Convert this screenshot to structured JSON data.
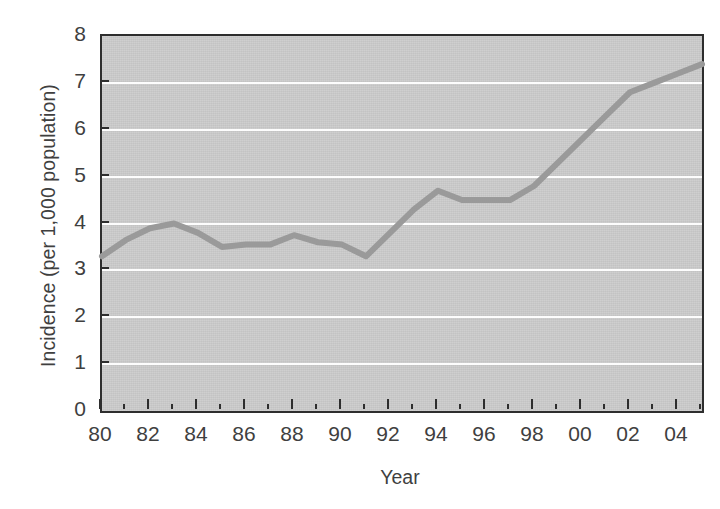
{
  "chart_data": {
    "type": "line",
    "title": "",
    "subtitle": "",
    "xlabel": "Year",
    "ylabel": "Incidence (per 1,000 population)",
    "xlim": [
      1980,
      2005
    ],
    "ylim": [
      0,
      8
    ],
    "grid": true,
    "grid_axis": "y",
    "legend": "none",
    "x_tick_labels": [
      "80",
      "82",
      "84",
      "86",
      "88",
      "90",
      "92",
      "94",
      "96",
      "98",
      "00",
      "02",
      "04"
    ],
    "x_tick_values": [
      1980,
      1982,
      1984,
      1986,
      1988,
      1990,
      1992,
      1994,
      1996,
      1998,
      2000,
      2002,
      2004
    ],
    "x_minor_tick_values": [
      1981,
      1983,
      1985,
      1987,
      1989,
      1991,
      1993,
      1995,
      1997,
      1999,
      2001,
      2003,
      2005
    ],
    "y_tick_labels": [
      "0",
      "1",
      "2",
      "3",
      "4",
      "5",
      "6",
      "7",
      "8"
    ],
    "y_tick_values": [
      0,
      1,
      2,
      3,
      4,
      5,
      6,
      7,
      8
    ],
    "gridline_values": [
      1,
      2,
      3,
      4,
      5,
      6,
      7
    ],
    "x": [
      1980,
      1981,
      1982,
      1983,
      1984,
      1985,
      1986,
      1987,
      1988,
      1989,
      1990,
      1991,
      1992,
      1993,
      1994,
      1995,
      1996,
      1997,
      1998,
      1999,
      2000,
      2001,
      2002,
      2003,
      2004,
      2005
    ],
    "values": [
      3.3,
      3.65,
      3.9,
      4.0,
      3.8,
      3.5,
      3.55,
      3.55,
      3.75,
      3.6,
      3.55,
      3.3,
      3.8,
      4.3,
      4.7,
      4.5,
      4.5,
      4.5,
      4.8,
      5.3,
      5.8,
      6.3,
      6.8,
      7.0,
      7.2,
      7.4
    ],
    "series": [
      {
        "name": "Incidence",
        "color": "#9a9a9a",
        "values": [
          3.3,
          3.65,
          3.9,
          4.0,
          3.8,
          3.5,
          3.55,
          3.55,
          3.75,
          3.6,
          3.55,
          3.3,
          3.8,
          4.3,
          4.7,
          4.5,
          4.5,
          4.5,
          4.8,
          5.3,
          5.8,
          6.3,
          6.8,
          7.0,
          7.2,
          7.4
        ]
      }
    ]
  },
  "style": {
    "plot_background": "#cbcbcb",
    "gridline_color": "#fdfdfd",
    "axis_color": "#2e2e2e",
    "line_color": "#9a9a9a",
    "text_color": "#3f3f3f",
    "page_background": "#ffffff"
  }
}
